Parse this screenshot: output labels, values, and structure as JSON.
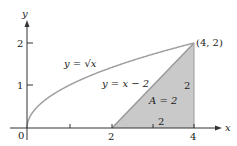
{
  "diagram": {
    "axes": {
      "x_label": "x",
      "y_label": "y",
      "origin_label": "0"
    },
    "x_ticks": [
      {
        "value": 1,
        "label": ""
      },
      {
        "value": 2,
        "label": "2"
      },
      {
        "value": 3,
        "label": ""
      },
      {
        "value": 4,
        "label": "4"
      }
    ],
    "y_ticks": [
      {
        "value": 1,
        "label": "1"
      },
      {
        "value": 2,
        "label": "2"
      }
    ],
    "curves": [
      {
        "name": "sqrt",
        "label": "y = √x",
        "color": "#a0a0a0"
      },
      {
        "name": "line",
        "label": "y = x − 2",
        "color": "#a0a0a0"
      }
    ],
    "point": {
      "label": "(4, 2)"
    },
    "region": {
      "label": "A = 2",
      "fill": "#c8c8c8",
      "height_label": "2",
      "base_label": "2"
    }
  }
}
